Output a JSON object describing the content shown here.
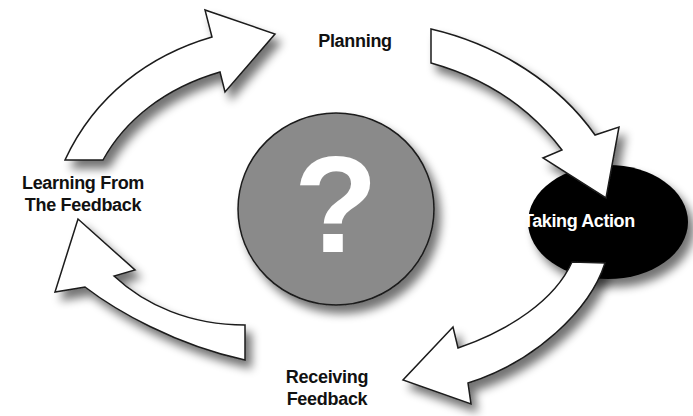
{
  "diagram": {
    "type": "cycle",
    "center": {
      "icon": "question-mark-icon",
      "symbol": "?",
      "fill": "#8a8a8a"
    },
    "stages": [
      {
        "id": "planning",
        "label": "Planning"
      },
      {
        "id": "taking-action",
        "label": "Taking Action",
        "style": "black-oval-white-text"
      },
      {
        "id": "receiving-feedback",
        "label_lines": [
          "Receiving",
          "Feedback"
        ]
      },
      {
        "id": "learning",
        "label_lines": [
          "Learning From",
          "The Feedback"
        ]
      }
    ],
    "arrows": [
      {
        "from": "learning",
        "to": "planning"
      },
      {
        "from": "planning",
        "to": "taking-action"
      },
      {
        "from": "taking-action",
        "to": "receiving-feedback"
      },
      {
        "from": "receiving-feedback",
        "to": "learning"
      }
    ],
    "colors": {
      "arrow_fill": "#ffffff",
      "arrow_stroke": "#1a1a1a",
      "oval_fill": "#000000",
      "circle_fill": "#8a8a8a",
      "shadow": "#9a9a9a"
    }
  }
}
